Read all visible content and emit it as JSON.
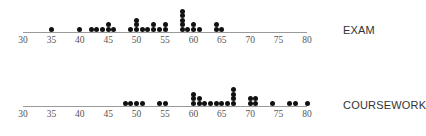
{
  "chart_data": [
    {
      "type": "dot",
      "title": "EXAM",
      "xlabel": "",
      "ylabel": "",
      "xlim": [
        30,
        80
      ],
      "ticks": [
        30,
        35,
        40,
        45,
        50,
        55,
        60,
        65,
        70,
        75,
        80
      ],
      "grid": false,
      "points": [
        {
          "x": 35,
          "count": 1
        },
        {
          "x": 40,
          "count": 1
        },
        {
          "x": 42,
          "count": 1
        },
        {
          "x": 43,
          "count": 1
        },
        {
          "x": 44,
          "count": 1
        },
        {
          "x": 45,
          "count": 2
        },
        {
          "x": 46,
          "count": 1
        },
        {
          "x": 49,
          "count": 1
        },
        {
          "x": 50,
          "count": 3
        },
        {
          "x": 51,
          "count": 1
        },
        {
          "x": 52,
          "count": 1
        },
        {
          "x": 53,
          "count": 2
        },
        {
          "x": 54,
          "count": 1
        },
        {
          "x": 55,
          "count": 2
        },
        {
          "x": 58,
          "count": 5
        },
        {
          "x": 59,
          "count": 1
        },
        {
          "x": 60,
          "count": 2
        },
        {
          "x": 61,
          "count": 1
        },
        {
          "x": 64,
          "count": 2
        },
        {
          "x": 65,
          "count": 1
        }
      ]
    },
    {
      "type": "dot",
      "title": "COURSEWORK",
      "xlabel": "",
      "ylabel": "",
      "xlim": [
        30,
        80
      ],
      "ticks": [
        30,
        35,
        40,
        45,
        50,
        55,
        60,
        65,
        70,
        75,
        80
      ],
      "grid": false,
      "points": [
        {
          "x": 48,
          "count": 1
        },
        {
          "x": 49,
          "count": 1
        },
        {
          "x": 50,
          "count": 1
        },
        {
          "x": 51,
          "count": 1
        },
        {
          "x": 54,
          "count": 1
        },
        {
          "x": 55,
          "count": 1
        },
        {
          "x": 60,
          "count": 3
        },
        {
          "x": 61,
          "count": 2
        },
        {
          "x": 62,
          "count": 1
        },
        {
          "x": 63,
          "count": 1
        },
        {
          "x": 64,
          "count": 1
        },
        {
          "x": 65,
          "count": 1
        },
        {
          "x": 66,
          "count": 1
        },
        {
          "x": 67,
          "count": 4
        },
        {
          "x": 70,
          "count": 2
        },
        {
          "x": 71,
          "count": 2
        },
        {
          "x": 74,
          "count": 1
        },
        {
          "x": 77,
          "count": 1
        },
        {
          "x": 78,
          "count": 1
        },
        {
          "x": 80,
          "count": 1
        }
      ]
    }
  ],
  "colors": {
    "dot": "#111111",
    "axis": "#9a9a9a",
    "label": "#333333"
  }
}
